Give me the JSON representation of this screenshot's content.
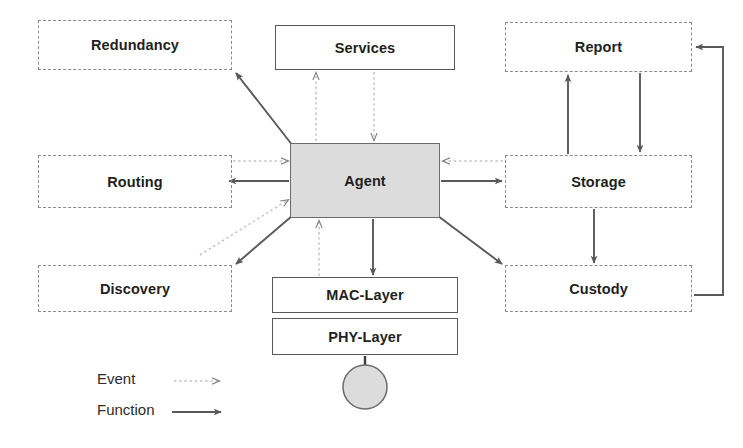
{
  "diagram": {
    "colors": {
      "dashed_border": "#8c8c8c",
      "solid_border": "#595959",
      "agent_fill": "#dcdcdc",
      "event_arrow": "#bfbfbf",
      "function_arrow": "#595959",
      "text": "#231f20"
    },
    "nodes": [
      {
        "id": "redundancy",
        "label": "Redundancy",
        "style": "dashdot",
        "x": 38,
        "y": 20,
        "w": 194,
        "h": 50
      },
      {
        "id": "services",
        "label": "Services",
        "style": "solid",
        "x": 275,
        "y": 25,
        "w": 180,
        "h": 45
      },
      {
        "id": "report",
        "label": "Report",
        "style": "dashdot",
        "x": 505,
        "y": 22,
        "w": 187,
        "h": 50
      },
      {
        "id": "routing",
        "label": "Routing",
        "style": "dashdot",
        "x": 38,
        "y": 155,
        "w": 194,
        "h": 53
      },
      {
        "id": "agent",
        "label": "Agent",
        "style": "agent",
        "x": 290,
        "y": 143,
        "w": 150,
        "h": 75
      },
      {
        "id": "storage",
        "label": "Storage",
        "style": "dashdot",
        "x": 505,
        "y": 155,
        "w": 187,
        "h": 53
      },
      {
        "id": "discovery",
        "label": "Discovery",
        "style": "dashdot",
        "x": 38,
        "y": 265,
        "w": 194,
        "h": 47
      },
      {
        "id": "mac_layer",
        "label": "MAC-Layer",
        "style": "solid",
        "x": 272,
        "y": 277,
        "w": 186,
        "h": 36
      },
      {
        "id": "custody",
        "label": "Custody",
        "style": "dashdot",
        "x": 505,
        "y": 265,
        "w": 187,
        "h": 47
      },
      {
        "id": "phy_layer",
        "label": "PHY-Layer",
        "style": "solid",
        "x": 272,
        "y": 318,
        "w": 186,
        "h": 37
      }
    ],
    "antenna": {
      "id": "radio-node",
      "cx": 365,
      "cy": 387,
      "rx": 22,
      "ry": 22
    },
    "edges": [
      {
        "from": "agent",
        "to": "redundancy",
        "kind": "function"
      },
      {
        "from": "agent",
        "to": "services",
        "kind": "event"
      },
      {
        "from": "services",
        "to": "agent",
        "kind": "event"
      },
      {
        "from": "routing",
        "to": "agent",
        "kind": "event"
      },
      {
        "from": "agent",
        "to": "routing",
        "kind": "function"
      },
      {
        "from": "discovery",
        "to": "agent",
        "kind": "event"
      },
      {
        "from": "agent",
        "to": "discovery",
        "kind": "function"
      },
      {
        "from": "storage",
        "to": "agent",
        "kind": "event"
      },
      {
        "from": "agent",
        "to": "storage",
        "kind": "function"
      },
      {
        "from": "agent",
        "to": "custody",
        "kind": "function"
      },
      {
        "from": "agent",
        "to": "mac_layer",
        "kind": "function"
      },
      {
        "from": "mac_layer",
        "to": "agent",
        "kind": "event"
      },
      {
        "from": "storage",
        "to": "report",
        "kind": "function"
      },
      {
        "from": "report",
        "to": "storage",
        "kind": "function"
      },
      {
        "from": "storage",
        "to": "custody",
        "kind": "function"
      },
      {
        "from": "custody",
        "to": "report",
        "kind": "function"
      }
    ]
  },
  "legend": {
    "items": [
      {
        "id": "event",
        "label": "Event",
        "kind": "event"
      },
      {
        "id": "function",
        "label": "Function",
        "kind": "function"
      }
    ]
  }
}
